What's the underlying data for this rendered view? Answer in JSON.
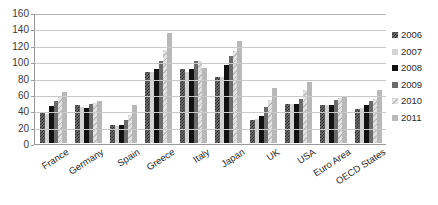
{
  "chart_data": {
    "type": "bar",
    "title": "",
    "xlabel": "",
    "ylabel": "",
    "ylim": [
      0,
      160
    ],
    "ytick_step": 20,
    "yticks": [
      0,
      20,
      40,
      60,
      80,
      100,
      120,
      140,
      160
    ],
    "ytick_labels": [
      "0",
      "20",
      "40",
      "60",
      "80",
      "100",
      "120",
      "140",
      "160"
    ],
    "grid": true,
    "grid_axis": "y",
    "legend_position": "right",
    "categories": [
      "France",
      "Germany",
      "Spain",
      "Greece",
      "Italy",
      "Japan",
      "UK",
      "USA",
      "Euro Area",
      "OECD States"
    ],
    "series": [
      {
        "name": "2006",
        "color": "#6f6f6f",
        "pattern": "checker",
        "values": [
          37,
          47,
          22,
          87,
          90,
          81,
          28,
          48,
          47,
          42
        ]
      },
      {
        "name": "2007",
        "color": "#d3d3d3",
        "pattern": "solid-light",
        "values": [
          35,
          44,
          21,
          87,
          87,
          81,
          29,
          48,
          46,
          43
        ]
      },
      {
        "name": "2008",
        "color": "#111111",
        "pattern": "solid-black",
        "values": [
          45,
          43,
          22,
          91,
          90,
          95,
          33,
          48,
          47,
          46
        ]
      },
      {
        "name": "2009",
        "color": "#6b6b6b",
        "pattern": "solid-dark",
        "values": [
          51,
          48,
          28,
          100,
          100,
          106,
          44,
          54,
          52,
          51
        ]
      },
      {
        "name": "2010",
        "color": "#e2e2e2",
        "pattern": "diagonal-light",
        "values": [
          56,
          49,
          34,
          114,
          100,
          112,
          52,
          65,
          55,
          54
        ]
      },
      {
        "name": "2011",
        "color": "#b8b8b8",
        "pattern": "solid-medium",
        "values": [
          62,
          51,
          47,
          134,
          92,
          125,
          67,
          74,
          58,
          65
        ]
      }
    ]
  }
}
